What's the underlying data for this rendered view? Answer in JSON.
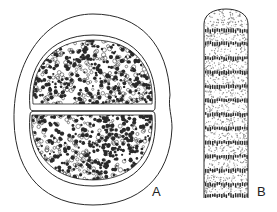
{
  "figure": {
    "panels": [
      {
        "id": "A",
        "label": "A",
        "description": "Ellipsoidal sheath containing two hemispherical cells with granular dotted contents",
        "label_pos": {
          "x": 152,
          "y": 185
        }
      },
      {
        "id": "B",
        "label": "B",
        "description": "Cylindrical filament with rounded apex, alternating stippled and dark transverse granule bands",
        "label_pos": {
          "x": 257,
          "y": 185
        }
      }
    ],
    "colors": {
      "ink": "#2a2a2a",
      "paper": "#ffffff",
      "stipple": "#8a8a8a"
    }
  }
}
